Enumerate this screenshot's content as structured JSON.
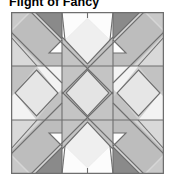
{
  "page": {
    "background": "#ffffff",
    "width": 176,
    "height": 184
  },
  "block_title": "Flight of Fancy",
  "quilt": {
    "name": "flight-of-fancy-block",
    "grid_rows": 3,
    "grid_cols": 3,
    "unit_count": 9,
    "outline_color": "#6e6e6e",
    "seam_color": "#6e6e6e",
    "palette": {
      "white": "#fdfdfd",
      "light": "#e3e3e3",
      "light_alt": "#d6d6d6",
      "medium": "#bdbdbd",
      "medium_dark": "#a8a8a8",
      "dark": "#969696",
      "darkest": "#8a8a8a",
      "seam": "#6e6e6e"
    },
    "units": [
      {
        "position": "top-left",
        "type": "corner-x-block",
        "dominant": "medium"
      },
      {
        "position": "top-center",
        "type": "peak-diamond",
        "dominant": "white"
      },
      {
        "position": "top-right",
        "type": "corner-x-block",
        "dominant": "medium"
      },
      {
        "position": "middle-left",
        "type": "square-on-point",
        "dominant": "light"
      },
      {
        "position": "center",
        "type": "square-on-point",
        "dominant": "light"
      },
      {
        "position": "middle-right",
        "type": "square-on-point",
        "dominant": "light"
      },
      {
        "position": "bottom-left",
        "type": "corner-x-block",
        "dominant": "medium"
      },
      {
        "position": "bottom-center",
        "type": "peak-diamond",
        "dominant": "white"
      },
      {
        "position": "bottom-right",
        "type": "corner-x-block",
        "dominant": "medium"
      }
    ]
  }
}
